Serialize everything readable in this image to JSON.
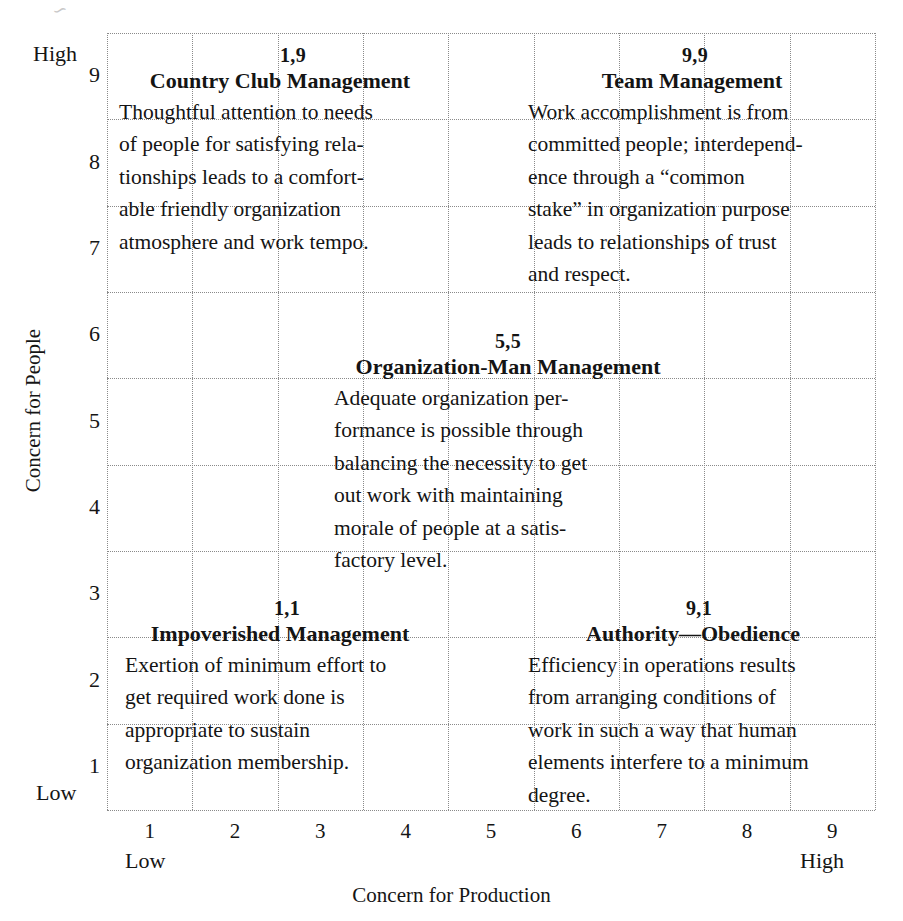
{
  "figure": {
    "type": "managerial-grid",
    "axes": {
      "x": {
        "title": "Concern for Production",
        "ticks": [
          "1",
          "2",
          "3",
          "4",
          "5",
          "6",
          "7",
          "8",
          "9"
        ],
        "low_label": "Low",
        "high_label": "High"
      },
      "y": {
        "title": "Concern for People",
        "ticks": [
          "9",
          "8",
          "7",
          "6",
          "5",
          "4",
          "3",
          "2",
          "1"
        ],
        "low_label": "Low",
        "high_label": "High"
      }
    },
    "grid": {
      "columns": 9,
      "rows": 9,
      "style": "dotted",
      "color": "#8a8a8a"
    }
  },
  "chart_data": {
    "type": "scatter",
    "xlabel": "Concern for Production",
    "ylabel": "Concern for People",
    "xlim": [
      0,
      9
    ],
    "ylim": [
      0,
      9
    ],
    "grid": true,
    "legend": "none",
    "points": [
      {
        "label": "Country Club Management",
        "coord": "1,9",
        "x": 1,
        "y": 9
      },
      {
        "label": "Team Management",
        "coord": "9,9",
        "x": 9,
        "y": 9
      },
      {
        "label": "Organization-Man Management",
        "coord": "5,5",
        "x": 5,
        "y": 5
      },
      {
        "label": "Impoverished Management",
        "coord": "1,1",
        "x": 1,
        "y": 1
      },
      {
        "label": "Authority—Obedience",
        "coord": "9,1",
        "x": 9,
        "y": 1
      }
    ]
  },
  "blocks": {
    "country_club": {
      "coord": "1,9",
      "title": "Country Club Management",
      "lines": [
        "Thoughtful attention to needs",
        "of people for satisfying rela-",
        "tionships leads to a comfort-",
        "able friendly organization",
        "atmosphere and work tempo."
      ]
    },
    "team": {
      "coord": "9,9",
      "title": "Team Management",
      "lines": [
        "Work accomplishment is from",
        "committed people; interdepend-",
        "ence through a “common",
        "stake” in organization purpose",
        "leads to relationships of trust",
        "and respect."
      ]
    },
    "organization_man": {
      "coord": "5,5",
      "title": "Organization-Man Management",
      "lines": [
        "Adequate organization per-",
        "formance is possible through",
        "balancing the necessity to get",
        "out work with maintaining",
        "morale of people at a satis-",
        "factory level."
      ]
    },
    "impoverished": {
      "coord": "1,1",
      "title": "Impoverished Management",
      "lines": [
        "Exertion of minimum effort to",
        "get required work done is",
        "appropriate to sustain",
        "organization membership."
      ]
    },
    "authority_obedience": {
      "coord": "9,1",
      "title": "Authority—Obedience",
      "lines": [
        "Efficiency in operations results",
        "from arranging conditions of",
        "work in such a way that human",
        "elements interfere to a minimum",
        "degree."
      ]
    }
  }
}
